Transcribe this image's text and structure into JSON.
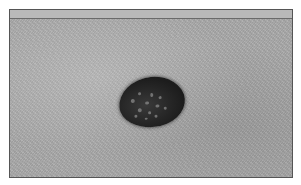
{
  "image": {
    "description": "Grayscale clinical photograph of a dark pigmented skin lesion with lighter speckles, framed by a thin dark border with a light top band",
    "colors": {
      "background": "#ffffff",
      "skin": "#a9a9a9",
      "top_band": "#b9b9b9",
      "border": "#555555",
      "lesion": "#1c1c1c"
    }
  }
}
